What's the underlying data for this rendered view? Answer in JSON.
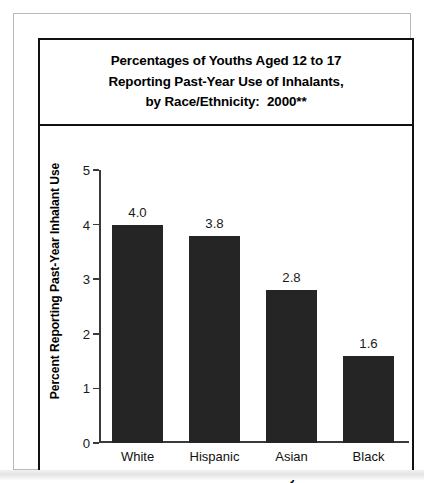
{
  "figure": {
    "title_lines": [
      "Percentages of Youths Aged 12 to 17",
      "Reporting Past-Year Use of Inhalants,",
      "by Race/Ethnicity:  2000**"
    ]
  },
  "chart_data": {
    "type": "bar",
    "title": "Percentages of Youths Aged 12 to 17 Reporting Past-Year Use of Inhalants, by Race/Ethnicity:  2000**",
    "categories": [
      "White",
      "Hispanic",
      "Asian",
      "Black"
    ],
    "values": [
      4.0,
      3.8,
      2.8,
      1.6
    ],
    "value_labels": [
      "4.0",
      "3.8",
      "2.8",
      "1.6"
    ],
    "xlabel": "Race/Ethnicity",
    "ylabel": "Percent Reporting Past-Year Inhalant Use",
    "ylim": [
      0,
      5
    ],
    "yticks": [
      0,
      1,
      2,
      3,
      4,
      5
    ],
    "ytick_labels": [
      "0",
      "1",
      "2",
      "3",
      "4",
      "5"
    ],
    "grid": false,
    "legend": false,
    "bar_color": "#252525",
    "axis_color": "#3a3a3a"
  }
}
